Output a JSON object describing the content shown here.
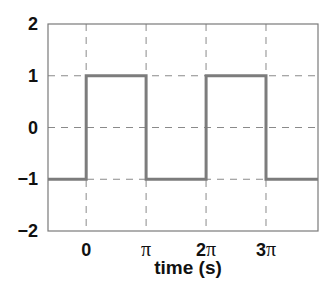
{
  "chart_data": {
    "type": "line",
    "title": "",
    "xlabel": "time (s)",
    "ylabel": "",
    "xlim": [
      -2.0,
      12.15
    ],
    "ylim": [
      -2,
      2
    ],
    "grid": true,
    "legend": null,
    "x_ticks": [
      0,
      3.1416,
      6.2832,
      9.4248
    ],
    "x_tick_labels": [
      "0",
      "π",
      "2π",
      "3π"
    ],
    "y_ticks": [
      -2,
      -1,
      0,
      1,
      2
    ],
    "y_tick_labels": [
      "−2",
      "−1",
      "0",
      "1",
      "2"
    ],
    "series": [
      {
        "name": "square wave",
        "color": "#7c7c7c",
        "x": [
          -2.0,
          0,
          0,
          3.1416,
          3.1416,
          6.2832,
          6.2832,
          9.4248,
          9.4248,
          12.15
        ],
        "y": [
          -1,
          -1,
          1,
          1,
          -1,
          -1,
          1,
          1,
          -1,
          -1
        ]
      }
    ]
  },
  "labels": {
    "xlabel": "time (s)",
    "yticks": [
      "2",
      "1",
      "0",
      "−1",
      "−2"
    ],
    "xticks": [
      "0",
      "π",
      "2π",
      "3π"
    ]
  }
}
